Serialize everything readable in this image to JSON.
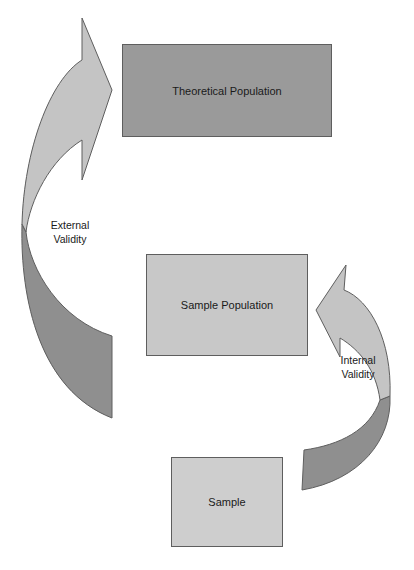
{
  "diagram": {
    "type": "validity-flow",
    "boxes": [
      {
        "id": "theoretical",
        "label": "Theoretical Population",
        "fill": "#9a9a9a"
      },
      {
        "id": "sample-pop",
        "label": "Sample Population",
        "fill": "#c8c8c8"
      },
      {
        "id": "sample",
        "label": "Sample",
        "fill": "#cecece"
      }
    ],
    "arrows": [
      {
        "id": "external",
        "label": "External\nValidity",
        "from": "Sample Population",
        "to": "Theoretical Population",
        "light_fill": "#c4c4c4",
        "dark_fill": "#8f8f8f"
      },
      {
        "id": "internal",
        "label": "Internal\nValidity",
        "from": "Sample",
        "to": "Sample Population",
        "light_fill": "#c4c4c4",
        "dark_fill": "#8f8f8f"
      }
    ],
    "stroke": "#5e5e5e"
  }
}
